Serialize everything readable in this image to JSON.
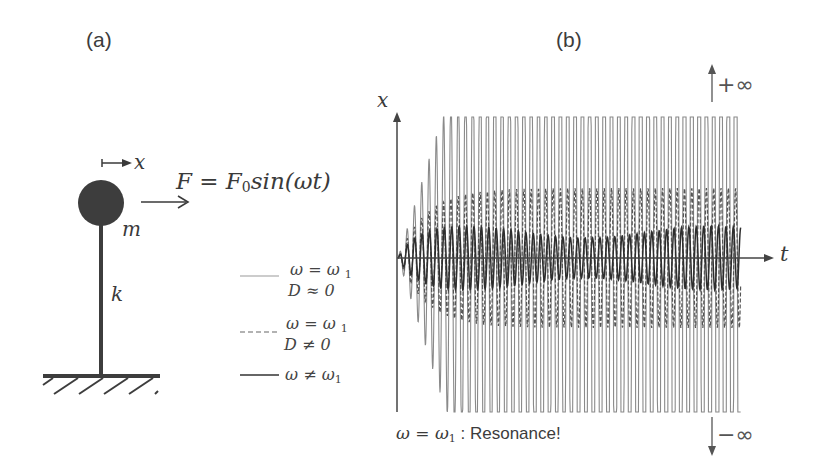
{
  "panels": {
    "a": {
      "label": "(a)",
      "displacement_label": "x",
      "mass_label": "m",
      "spring_label": "k",
      "force_label": "F = F",
      "force_sub": "0",
      "force_rest": "sin(ωt)"
    },
    "b": {
      "label": "(b)",
      "y_axis_label": "x",
      "x_axis_label": "t",
      "plus_infinity": "+∞",
      "minus_infinity": "−∞",
      "caption_math": "ω = ω",
      "caption_sub": "1",
      "caption_text": " : Resonance!"
    }
  },
  "legend": [
    {
      "style": "solid-light",
      "line1": "ω = ω",
      "line1_sub": "1",
      "line2": "D ≈ 0"
    },
    {
      "style": "dashed",
      "line1": "ω = ω",
      "line1_sub": "1",
      "line2": "D ≠ 0"
    },
    {
      "style": "solid-dark",
      "line1": "ω ≠ ω",
      "line1_sub": "1",
      "line2": ""
    }
  ],
  "colors": {
    "ink": "#3a3a3a",
    "light_trace": "#8a8a8a",
    "dashed_trace": "#555555",
    "dark_trace": "#2e2e2e",
    "mass": "#3d3d3d"
  },
  "chart_data": {
    "type": "line",
    "title": "",
    "xlabel": "t",
    "ylabel": "x",
    "series": [
      {
        "name": "ω = ω1, D ≈ 0",
        "style": "solid-light",
        "behavior": "amplitude grows without bound (±∞)"
      },
      {
        "name": "ω = ω1, D ≠ 0",
        "style": "dashed",
        "behavior": "amplitude grows then saturates at large steady value"
      },
      {
        "name": "ω ≠ ω1",
        "style": "solid-dark",
        "behavior": "small bounded steady oscillation"
      }
    ],
    "annotations": [
      "+∞",
      "−∞",
      "ω = ω1 : Resonance!"
    ]
  }
}
